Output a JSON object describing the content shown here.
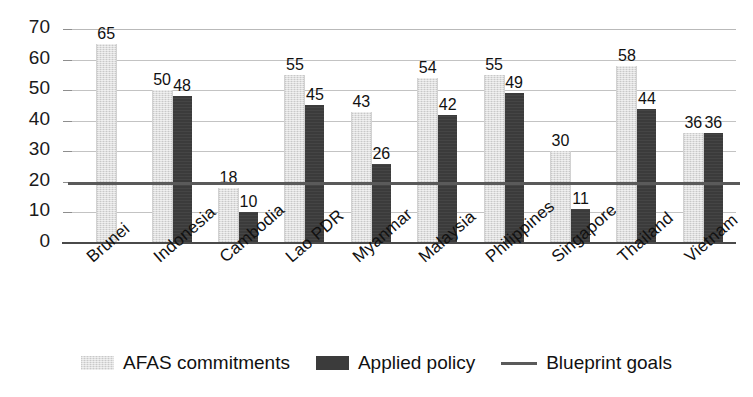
{
  "chart_data": {
    "type": "bar",
    "title": "",
    "subtitle": "",
    "xlabel": "",
    "ylabel": "",
    "ylim": [
      0,
      70
    ],
    "ytick_step": 10,
    "yticks": [
      "0",
      "10",
      "20",
      "30",
      "40",
      "50",
      "60",
      "70"
    ],
    "grid": true,
    "legend_position": "bottom",
    "categories": [
      "Brunei",
      "Indonesia",
      "Cambodia",
      "Lao PDR",
      "Myanmar",
      "Malaysia",
      "Philippines",
      "Singapore",
      "Thailand",
      "Vietnam"
    ],
    "series": [
      {
        "name": "AFAS commitments",
        "color": "#dedede",
        "values": [
          65,
          50,
          18,
          55,
          43,
          54,
          55,
          30,
          58,
          36
        ],
        "labels": [
          "65",
          "50",
          "18",
          "55",
          "43",
          "54",
          "55",
          "30",
          "58",
          "36"
        ]
      },
      {
        "name": "Applied policy",
        "color": "#3b3b3b",
        "values": [
          null,
          48,
          10,
          45,
          26,
          42,
          49,
          11,
          44,
          36
        ],
        "labels": [
          "",
          "48",
          "10",
          "45",
          "26",
          "42",
          "49",
          "11",
          "44",
          "36"
        ]
      }
    ],
    "reference_line": {
      "name": "Blueprint goals",
      "value": 20,
      "color": "#5a5a5a"
    },
    "legend": [
      {
        "label": "AFAS commitments",
        "marker": "swatch-light",
        "color": "#dedede"
      },
      {
        "label": "Applied policy",
        "marker": "swatch-dark",
        "color": "#3b3b3b"
      },
      {
        "label": "Blueprint goals",
        "marker": "line",
        "color": "#5a5a5a"
      }
    ]
  }
}
